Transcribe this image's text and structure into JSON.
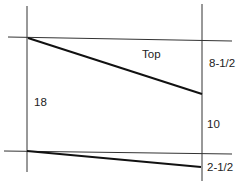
{
  "diagram": {
    "labels": {
      "top": "Top",
      "left_height": "18",
      "right_upper": "8-1/2",
      "right_middle": "10",
      "right_lower": "2-1/2"
    },
    "colors": {
      "line": "#222222",
      "background": "#ffffff"
    }
  }
}
